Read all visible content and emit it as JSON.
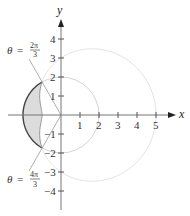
{
  "diagram": {
    "type": "polar-region",
    "axes": {
      "x_label": "x",
      "y_label": "y",
      "x_ticks": [
        "1",
        "2",
        "3",
        "4",
        "5"
      ],
      "y_ticks_pos": [
        "1",
        "2",
        "3",
        "4"
      ],
      "y_ticks_neg": [
        "−1",
        "−2",
        "−3",
        "−4"
      ]
    },
    "curves": [
      {
        "name": "circle",
        "equation": "r = 2",
        "color": "#cccccc"
      },
      {
        "name": "limacon",
        "equation": "r = 3 + 2cos θ",
        "color": "#dddddd"
      }
    ],
    "shaded_region_color": "#d9d9d9",
    "boundary_color": "#444444",
    "annotations": {
      "upper": {
        "theta": "θ",
        "eq": "=",
        "num": "2π",
        "den": "3"
      },
      "lower": {
        "theta": "θ",
        "eq": "=",
        "num": "4π",
        "den": "3"
      }
    }
  }
}
